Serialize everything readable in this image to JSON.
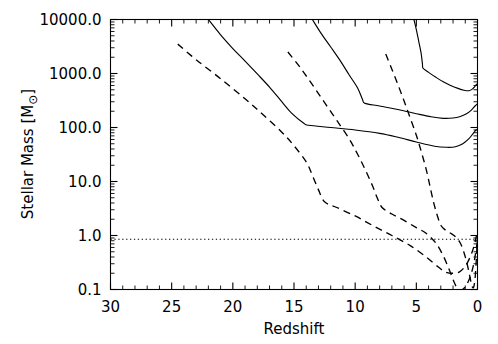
{
  "chart_data": {
    "type": "line",
    "title": "",
    "xlabel": "Redshift",
    "ylabel": "Stellar Mass [M☉]",
    "ylabel_prefix": "Stellar Mass [M",
    "ylabel_sub": "⊙",
    "ylabel_suffix": "]",
    "xlim": [
      30,
      0
    ],
    "xlim_reversed": true,
    "ylim": [
      0.1,
      10000.0
    ],
    "yscale": "log",
    "xscale": "linear",
    "grid": false,
    "legend": "none",
    "xticks": [
      30,
      25,
      20,
      15,
      10,
      5,
      0
    ],
    "xticklabels": [
      "30",
      "25",
      "20",
      "15",
      "10",
      "5",
      "0"
    ],
    "xminor_interval": 1,
    "yticks": [
      0.1,
      1.0,
      10.0,
      100.0,
      1000.0,
      10000.0
    ],
    "yticklabels": [
      "0.1",
      "1.0",
      "10.0",
      "100.0",
      "1000.0",
      "10000.0"
    ],
    "series": [
      {
        "name": "solid-curve-1",
        "style": "solid",
        "points": [
          [
            22.0,
            10000
          ],
          [
            21.0,
            5200
          ],
          [
            20.0,
            2900
          ],
          [
            19.0,
            1700
          ],
          [
            18.0,
            980
          ],
          [
            17.0,
            560
          ],
          [
            16.0,
            300
          ],
          [
            15.2,
            185
          ],
          [
            14.2,
            120
          ],
          [
            13.8,
            110
          ],
          [
            12.0,
            100
          ],
          [
            10.0,
            90
          ],
          [
            8.0,
            78
          ],
          [
            6.5,
            66
          ],
          [
            5.0,
            54
          ],
          [
            3.5,
            45
          ],
          [
            2.5,
            43
          ],
          [
            1.8,
            44
          ],
          [
            1.2,
            50
          ],
          [
            0.7,
            62
          ],
          [
            0.35,
            78
          ],
          [
            0.12,
            90
          ],
          [
            0.0,
            92
          ]
        ]
      },
      {
        "name": "solid-curve-2",
        "style": "solid",
        "points": [
          [
            13.5,
            10000
          ],
          [
            12.8,
            5600
          ],
          [
            12.0,
            3100
          ],
          [
            11.2,
            1700
          ],
          [
            10.5,
            950
          ],
          [
            9.8,
            540
          ],
          [
            9.4,
            330
          ],
          [
            9.2,
            280
          ],
          [
            8.0,
            250
          ],
          [
            6.5,
            215
          ],
          [
            5.0,
            180
          ],
          [
            3.8,
            158
          ],
          [
            2.8,
            148
          ],
          [
            2.0,
            150
          ],
          [
            1.4,
            160
          ],
          [
            0.9,
            180
          ],
          [
            0.5,
            210
          ],
          [
            0.2,
            250
          ],
          [
            0.0,
            275
          ]
        ]
      },
      {
        "name": "solid-curve-3",
        "style": "solid",
        "points": [
          [
            5.2,
            10000
          ],
          [
            5.0,
            6500
          ],
          [
            4.8,
            3900
          ],
          [
            4.6,
            2300
          ],
          [
            4.5,
            1500
          ],
          [
            4.45,
            1250
          ],
          [
            4.0,
            1050
          ],
          [
            3.4,
            850
          ],
          [
            2.8,
            700
          ],
          [
            2.2,
            600
          ],
          [
            1.6,
            530
          ],
          [
            1.1,
            490
          ],
          [
            0.7,
            480
          ],
          [
            0.4,
            520
          ],
          [
            0.15,
            600
          ],
          [
            0.0,
            650
          ]
        ]
      },
      {
        "name": "dashed-curve-1",
        "style": "dashed",
        "points": [
          [
            24.5,
            3500
          ],
          [
            23.0,
            1800
          ],
          [
            21.0,
            800
          ],
          [
            19.0,
            340
          ],
          [
            17.5,
            170
          ],
          [
            16.0,
            82
          ],
          [
            15.0,
            46
          ],
          [
            14.0,
            23
          ],
          [
            13.5,
            13
          ],
          [
            13.0,
            7.0
          ],
          [
            12.5,
            4.2
          ],
          [
            11.5,
            3.3
          ],
          [
            10.0,
            2.3
          ],
          [
            8.5,
            1.5
          ],
          [
            7.0,
            1.0
          ],
          [
            5.5,
            0.65
          ],
          [
            4.2,
            0.4
          ],
          [
            3.2,
            0.26
          ],
          [
            2.6,
            0.21
          ],
          [
            2.0,
            0.2
          ],
          [
            1.5,
            0.21
          ],
          [
            1.0,
            0.27
          ],
          [
            0.6,
            0.4
          ],
          [
            0.3,
            0.62
          ],
          [
            0.1,
            0.95
          ],
          [
            0.0,
            1.25
          ]
        ]
      },
      {
        "name": "dashed-curve-2",
        "style": "dashed",
        "points": [
          [
            15.5,
            2500
          ],
          [
            14.5,
            1300
          ],
          [
            13.5,
            620
          ],
          [
            12.5,
            290
          ],
          [
            11.5,
            135
          ],
          [
            10.5,
            62
          ],
          [
            9.8,
            32
          ],
          [
            9.2,
            17
          ],
          [
            8.6,
            8.5
          ],
          [
            8.2,
            5.0
          ],
          [
            7.8,
            3.3
          ],
          [
            7.0,
            2.5
          ],
          [
            6.0,
            1.9
          ],
          [
            5.0,
            1.4
          ],
          [
            4.2,
            1.1
          ],
          [
            3.4,
            0.72
          ],
          [
            2.8,
            0.42
          ],
          [
            2.3,
            0.23
          ],
          [
            1.9,
            0.135
          ],
          [
            1.6,
            0.102
          ],
          [
            1.3,
            0.098
          ],
          [
            1.0,
            0.112
          ],
          [
            0.7,
            0.15
          ],
          [
            0.45,
            0.22
          ],
          [
            0.25,
            0.35
          ],
          [
            0.1,
            0.58
          ],
          [
            0.0,
            0.8
          ]
        ]
      },
      {
        "name": "dashed-curve-3",
        "style": "dashed",
        "points": [
          [
            7.5,
            2300
          ],
          [
            7.0,
            1200
          ],
          [
            6.5,
            620
          ],
          [
            6.0,
            310
          ],
          [
            5.5,
            150
          ],
          [
            5.0,
            72
          ],
          [
            4.6,
            36
          ],
          [
            4.2,
            17
          ],
          [
            3.9,
            8.5
          ],
          [
            3.6,
            4.2
          ],
          [
            3.3,
            2.4
          ],
          [
            3.0,
            1.55
          ],
          [
            2.6,
            1.25
          ],
          [
            2.2,
            1.1
          ],
          [
            1.8,
            0.95
          ],
          [
            1.4,
            0.72
          ],
          [
            1.1,
            0.48
          ],
          [
            0.85,
            0.3
          ],
          [
            0.65,
            0.185
          ],
          [
            0.5,
            0.128
          ],
          [
            0.38,
            0.108
          ],
          [
            0.28,
            0.118
          ],
          [
            0.18,
            0.18
          ],
          [
            0.1,
            0.35
          ],
          [
            0.04,
            0.65
          ],
          [
            0.0,
            0.95
          ]
        ]
      },
      {
        "name": "dotted-threshold-line",
        "style": "dotted",
        "points": [
          [
            30.0,
            0.85
          ],
          [
            0.0,
            0.85
          ]
        ],
        "value": 0.85
      }
    ]
  }
}
